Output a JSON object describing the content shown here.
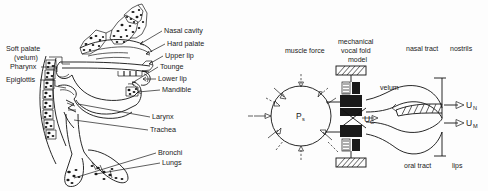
{
  "figure": {
    "background_color": "#fdfdfd",
    "ink_color": "#1a1a1a"
  },
  "left_panel": {
    "name": "human-vocal-tract-anatomy",
    "description": "Mid-sagittal cross-section line drawing of the human head, throat and lungs with leader-line callout labels",
    "labels_left": [
      {
        "id": "soft-palate",
        "text": "Soft palate",
        "x": 6,
        "y": 51
      },
      {
        "id": "velum",
        "text": "(velum)",
        "x": 14,
        "y": 60
      },
      {
        "id": "pharynx",
        "text": "Pharynx",
        "x": 10,
        "y": 69
      },
      {
        "id": "epiglottis",
        "text": "Epiglottis",
        "x": 6,
        "y": 82
      }
    ],
    "labels_right": [
      {
        "id": "nasal-cavity",
        "text": "Nasal cavity",
        "x": 164,
        "y": 33
      },
      {
        "id": "hard-palate",
        "text": "Hard palate",
        "x": 167,
        "y": 46
      },
      {
        "id": "upper-lip",
        "text": "Upper lip",
        "x": 165,
        "y": 58
      },
      {
        "id": "tounge",
        "text": "Tounge",
        "x": 160,
        "y": 69
      },
      {
        "id": "lower-lip",
        "text": "Lower lip",
        "x": 158,
        "y": 81
      },
      {
        "id": "mandible",
        "text": "Mandible",
        "x": 162,
        "y": 92
      },
      {
        "id": "larynx",
        "text": "Larynx",
        "x": 152,
        "y": 119
      },
      {
        "id": "trachea",
        "text": "Trachea",
        "x": 150,
        "y": 132
      },
      {
        "id": "bronchi",
        "text": "Bronchi",
        "x": 158,
        "y": 155
      },
      {
        "id": "lungs",
        "text": "Lungs",
        "x": 162,
        "y": 165
      }
    ]
  },
  "right_panel": {
    "name": "mechanical-speech-production-model",
    "description": "Schematic block diagram of a mechanical speech production model: lung pressure sphere, mechanical vocal fold model, nasal and oral tracts ending at nostrils and lips",
    "top_labels": [
      {
        "id": "muscle-force",
        "text": "muscle force",
        "x": 285,
        "y": 53
      },
      {
        "id": "mechanical",
        "text": "mechanical",
        "x": 338,
        "y": 44
      },
      {
        "id": "vocal-fold",
        "text": "vocal fold",
        "x": 341,
        "y": 53
      },
      {
        "id": "model",
        "text": "model",
        "x": 348,
        "y": 62
      },
      {
        "id": "nasal-tract",
        "text": "nasal tract",
        "x": 406,
        "y": 51
      },
      {
        "id": "nostrils",
        "text": "nostrils",
        "x": 450,
        "y": 51
      }
    ],
    "inner_labels": [
      {
        "id": "velum",
        "text": "velum",
        "x": 380,
        "y": 90
      },
      {
        "id": "oral-tract",
        "text": "oral tract",
        "x": 404,
        "y": 168
      },
      {
        "id": "lips",
        "text": "lips",
        "x": 452,
        "y": 168
      }
    ],
    "symbols": [
      {
        "id": "subglottal-pressure",
        "base": "P",
        "sub": "s",
        "x": 303,
        "y": 117
      },
      {
        "id": "glottal-flow",
        "base": "U",
        "sub": "G",
        "x": 365,
        "y": 118
      },
      {
        "id": "nasal-flow",
        "base": "U",
        "sub": "N",
        "x": 466,
        "y": 108
      },
      {
        "id": "oral-flow",
        "base": "U",
        "sub": "M",
        "x": 466,
        "y": 126
      }
    ]
  }
}
